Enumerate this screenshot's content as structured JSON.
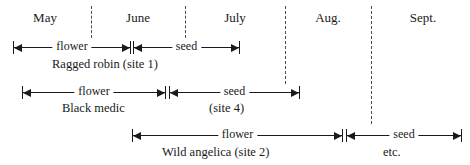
{
  "figure": {
    "type": "timeline-gantt",
    "axis": {
      "label": "months",
      "months": [
        {
          "name": "May",
          "center_x": 45
        },
        {
          "name": "June",
          "center_x": 138
        },
        {
          "name": "July",
          "center_x": 235
        },
        {
          "name": "Aug.",
          "center_x": 328
        },
        {
          "name": "Sept.",
          "center_x": 423
        }
      ],
      "dividers": [
        {
          "x": 91,
          "top": 6,
          "bottom": 38
        },
        {
          "x": 185,
          "top": 6,
          "bottom": 38
        },
        {
          "x": 285,
          "top": 6,
          "bottom": 84
        },
        {
          "x": 371,
          "top": 6,
          "bottom": 124
        }
      ]
    },
    "rows": [
      {
        "caption": "Ragged robin (site 1)",
        "caption_x": 52,
        "caption_y": 57,
        "bar_y": 41,
        "segments": [
          {
            "label": "flower",
            "start_x": 13,
            "end_x": 131,
            "left_end": "arrow",
            "right_end": "arrow"
          },
          {
            "label": "seed",
            "start_x": 133,
            "end_x": 240,
            "left_end": "arrow",
            "right_end": "arrow"
          }
        ]
      },
      {
        "caption": "Black medic",
        "caption_x": 62,
        "caption_y": 101,
        "bar_y": 86,
        "segments": [
          {
            "label": "flower",
            "start_x": 22,
            "end_x": 166,
            "left_end": "arrow",
            "right_end": "arrow"
          },
          {
            "label": "seed",
            "start_x": 169,
            "end_x": 300,
            "left_end": "arrow",
            "right_end": "arrow"
          }
        ]
      },
      {
        "caption": "Wild angelica (site 2)",
        "caption_x": 162,
        "caption_y": 145,
        "bar_y": 129,
        "segments": [
          {
            "label": "flower",
            "start_x": 132,
            "end_x": 343,
            "left_end": "arrow",
            "right_end": "arrow"
          },
          {
            "label": "seed",
            "start_x": 346,
            "end_x": 462,
            "left_end": "arrow",
            "right_end": "arrow"
          }
        ]
      }
    ],
    "annotations": [
      {
        "text": "(site 4)",
        "x": 209,
        "y": 101
      },
      {
        "text": "etc.",
        "x": 383,
        "y": 145
      }
    ],
    "colors": {
      "ink": "#1a1a1a",
      "divider": "#4a4a4a",
      "background": "#ffffff"
    }
  }
}
